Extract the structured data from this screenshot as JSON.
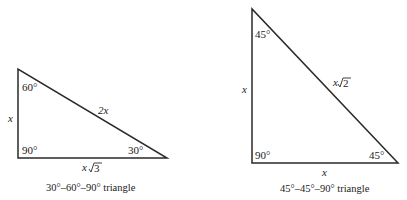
{
  "triangles": [
    {
      "caption": "30°–60°–90° triangle",
      "angles": {
        "top": "60°",
        "right_angle": "90°",
        "bottom_right": "30°"
      },
      "sides": {
        "vertical": "x",
        "hypotenuse": "2x",
        "base_var": "x",
        "base_rad": "3"
      }
    },
    {
      "caption": "45°–45°–90° triangle",
      "angles": {
        "top": "45°",
        "right_angle": "90°",
        "bottom_right": "45°"
      },
      "sides": {
        "vertical": "x",
        "hypotenuse_var": "x",
        "hypotenuse_rad": "2",
        "base": "x"
      }
    }
  ],
  "colors": {
    "stroke": "#2a2a2a",
    "background": "#ffffff"
  }
}
